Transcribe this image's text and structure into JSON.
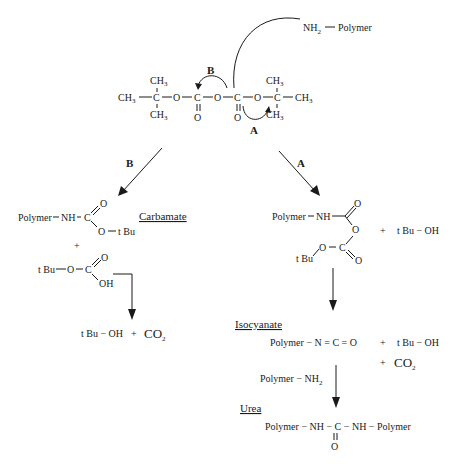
{
  "reagent": {
    "amine": "NH",
    "amine_sub": "2",
    "polymer": "Polymer"
  },
  "boc_anhydride": {
    "ch3": "CH",
    "ch3_sub": "3",
    "c": "C",
    "o": "O"
  },
  "path_labels": {
    "a": "A",
    "b": "B"
  },
  "path_b": {
    "header": "Carbamate",
    "carbamate": {
      "polymer": "Polymer",
      "nh": "NH",
      "c": "C",
      "o": "O",
      "tbu": "t Bu"
    },
    "plus": "+",
    "acid": {
      "tbu": "t Bu",
      "o": "O",
      "c": "C",
      "oh": "OH"
    },
    "products": {
      "tbuoh": "t Bu − OH",
      "plus": "+",
      "co2": "CO",
      "co2_sub": "2"
    }
  },
  "path_a": {
    "intermediate": {
      "polymer": "Polymer",
      "nh": "NH",
      "o": "O",
      "c": "C",
      "tbu": "t Bu"
    },
    "plus": "+",
    "tbuoh": "t Bu − OH",
    "isocyanate_header": "Isocyanate",
    "isocyanate": "Polymer − N = C = O",
    "byproducts": {
      "plus1": "+",
      "tbuoh": "t Bu − OH",
      "plus2": "+",
      "co2": "CO",
      "co2_sub": "2"
    },
    "reagent": {
      "polymer": "Polymer − NH",
      "sub": "2"
    },
    "urea_header": "Urea",
    "urea": {
      "left": "Polymer − NH − C − NH − Polymer",
      "o": "O"
    }
  }
}
